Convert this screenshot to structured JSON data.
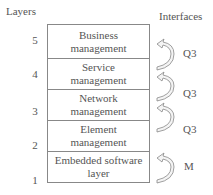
{
  "headers": {
    "left": "Layers",
    "right": "Interfaces"
  },
  "layers": [
    {
      "number": "5",
      "line1": "Business",
      "line2": "management"
    },
    {
      "number": "4",
      "line1": "Service",
      "line2": "management"
    },
    {
      "number": "3",
      "line1": "Network",
      "line2": "management"
    },
    {
      "number": "2",
      "line1": "Element",
      "line2": "management"
    },
    {
      "number": "1",
      "line1": "Embedded software",
      "line2": "layer"
    }
  ],
  "interfaces": [
    {
      "label": "Q3",
      "between": "5-4",
      "icon": "curved-arrow-up-icon"
    },
    {
      "label": "Q3",
      "between": "4-3",
      "icon": "curved-arrow-up-icon"
    },
    {
      "label": "Q3",
      "between": "3-2",
      "icon": "curved-arrow-up-icon"
    },
    {
      "label": "M",
      "between": "2-1",
      "icon": "curved-arrow-up-icon"
    }
  ],
  "colors": {
    "line": "#888888",
    "text": "#555555",
    "arrow_fill": "#f4f4f4"
  }
}
